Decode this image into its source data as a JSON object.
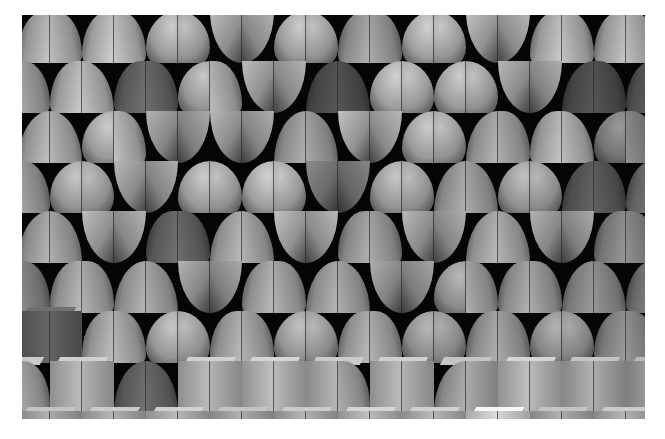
{
  "image": {
    "description": "Grayscale 3D render of a staggered wall of modular tiles: paired quarter-circle petals, domes and cubes on black",
    "frame": {
      "x": 22,
      "y": 15,
      "width": 623,
      "height": 404
    },
    "background": "#050505",
    "page_background": "#ffffff"
  },
  "grid": {
    "row_pitch": 50,
    "col_pitch": 64,
    "rows": [
      {
        "offset": -4,
        "tiles": [
          [
            "L",
            "R",
            0.78
          ],
          [
            "L",
            "R",
            0.82
          ],
          [
            "D",
            "D",
            0.8
          ],
          [
            "V",
            "V",
            0.74
          ],
          [
            "D",
            "D",
            0.8
          ],
          [
            "L",
            "R",
            0.7
          ],
          [
            "D",
            "D",
            0.82
          ],
          [
            "V",
            "V",
            0.76
          ],
          [
            "L",
            "R",
            0.8
          ],
          [
            "L",
            "R",
            0.78
          ]
        ]
      },
      {
        "offset": -36,
        "tiles": [
          [
            "R",
            "R",
            0.72
          ],
          [
            "L",
            "L",
            0.8
          ],
          [
            "L",
            "R",
            0.45
          ],
          [
            "D",
            "R",
            0.78
          ],
          [
            "V",
            "V",
            0.74
          ],
          [
            "R",
            "L",
            0.35
          ],
          [
            "D",
            "D",
            0.82
          ],
          [
            "D",
            "D",
            0.8
          ],
          [
            "V",
            "V",
            0.72
          ],
          [
            "R",
            "R",
            0.35
          ],
          [
            "L",
            "R",
            0.4
          ]
        ]
      },
      {
        "offset": -4,
        "tiles": [
          [
            "R",
            "L",
            0.76
          ],
          [
            "D",
            "R",
            0.8
          ],
          [
            "V",
            "V",
            0.7
          ],
          [
            "V",
            "V",
            0.72
          ],
          [
            "R",
            "L",
            0.7
          ],
          [
            "V",
            "V",
            0.76
          ],
          [
            "D",
            "D",
            0.8
          ],
          [
            "R",
            "R",
            0.72
          ],
          [
            "L",
            "L",
            0.78
          ],
          [
            "D",
            "R",
            0.6
          ]
        ]
      },
      {
        "offset": -36,
        "tiles": [
          [
            "L",
            "R",
            0.7
          ],
          [
            "D",
            "D",
            0.78
          ],
          [
            "V",
            "V",
            0.72
          ],
          [
            "D",
            "D",
            0.8
          ],
          [
            "D",
            "D",
            0.82
          ],
          [
            "V",
            "V",
            0.55
          ],
          [
            "D",
            "D",
            0.78
          ],
          [
            "R",
            "L",
            0.7
          ],
          [
            "D",
            "D",
            0.76
          ],
          [
            "R",
            "R",
            0.4
          ],
          [
            "L",
            "R",
            0.5
          ]
        ]
      },
      {
        "offset": -4,
        "tiles": [
          [
            "R",
            "L",
            0.72
          ],
          [
            "V",
            "V",
            0.74
          ],
          [
            "L",
            "R",
            0.45
          ],
          [
            "R",
            "L",
            0.74
          ],
          [
            "V",
            "V",
            0.76
          ],
          [
            "L",
            "R",
            0.7
          ],
          [
            "V",
            "V",
            0.72
          ],
          [
            "R",
            "L",
            0.74
          ],
          [
            "V",
            "V",
            0.7
          ],
          [
            "L",
            "R",
            0.6
          ]
        ]
      },
      {
        "offset": -36,
        "tiles": [
          [
            "R",
            "R",
            0.6
          ],
          [
            "L",
            "R",
            0.74
          ],
          [
            "R",
            "L",
            0.72
          ],
          [
            "V",
            "V",
            0.7
          ],
          [
            "L",
            "R",
            0.74
          ],
          [
            "R",
            "L",
            0.72
          ],
          [
            "V",
            "V",
            0.68
          ],
          [
            "D",
            "R",
            0.72
          ],
          [
            "L",
            "R",
            0.7
          ],
          [
            "R",
            "L",
            0.62
          ],
          [
            "L",
            "R",
            0.55
          ]
        ]
      },
      {
        "offset": -4,
        "tiles": [
          [
            "C",
            "C",
            0.4
          ],
          [
            "L",
            "R",
            0.76
          ],
          [
            "D",
            "D",
            0.78
          ],
          [
            "L",
            "R",
            0.74
          ],
          [
            "D",
            "D",
            0.76
          ],
          [
            "L",
            "R",
            0.74
          ],
          [
            "D",
            "D",
            0.72
          ],
          [
            "L",
            "R",
            0.7
          ],
          [
            "D",
            "D",
            0.7
          ],
          [
            "L",
            "R",
            0.62
          ]
        ]
      },
      {
        "offset": -36,
        "tiles": [
          [
            "C",
            "R",
            0.72
          ],
          [
            "C",
            "C",
            0.74
          ],
          [
            "R",
            "L",
            0.45
          ],
          [
            "C",
            "C",
            0.74
          ],
          [
            "C",
            "C",
            0.76
          ],
          [
            "C",
            "R",
            0.72
          ],
          [
            "C",
            "C",
            0.74
          ],
          [
            "R",
            "C",
            0.7
          ],
          [
            "C",
            "C",
            0.76
          ],
          [
            "C",
            "C",
            0.7
          ],
          [
            "C",
            "R",
            0.66
          ]
        ]
      },
      {
        "offset": -4,
        "tiles": [
          [
            "C",
            "C",
            0.7
          ],
          [
            "C",
            "C",
            0.72
          ],
          [
            "C",
            "C",
            0.74
          ],
          [
            "C",
            "C",
            0.7
          ],
          [
            "C",
            "C",
            0.72
          ],
          [
            "C",
            "C",
            0.76
          ],
          [
            "C",
            "C",
            0.74
          ],
          [
            "C",
            "C",
            0.88
          ],
          [
            "C",
            "C",
            0.7
          ],
          [
            "C",
            "C",
            0.72
          ]
        ]
      }
    ]
  },
  "shape_codes": {
    "L": "quarter-circle petal bulging left",
    "R": "quarter-circle petal bulging right",
    "D": "dome half",
    "V": "inward cusp petal",
    "C": "cube face"
  }
}
